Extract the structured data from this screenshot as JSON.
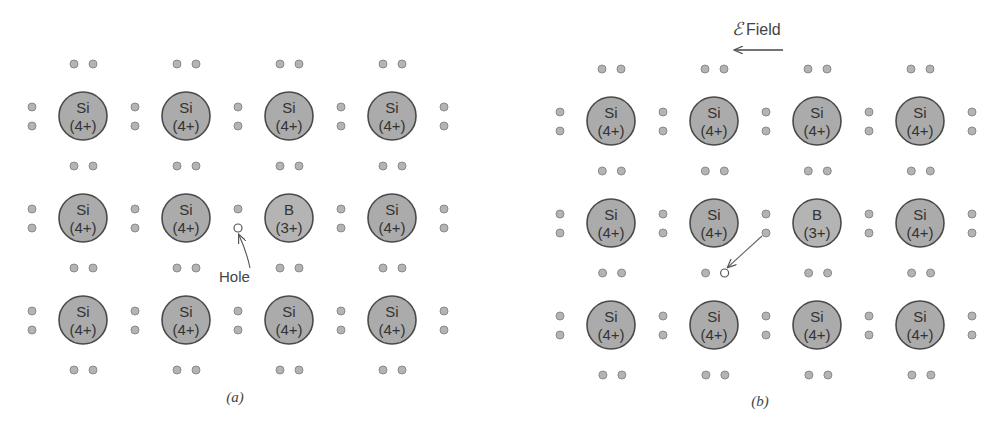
{
  "figure": {
    "panels": [
      {
        "id": "a",
        "caption": "(a)",
        "origin_x": 83,
        "origin_y": 116,
        "col_spacing": 103,
        "row_spacing": 102,
        "atoms": [
          [
            {
              "symbol": "Si",
              "charge": "(4+)"
            },
            {
              "symbol": "Si",
              "charge": "(4+)"
            },
            {
              "symbol": "Si",
              "charge": "(4+)"
            },
            {
              "symbol": "Si",
              "charge": "(4+)"
            }
          ],
          [
            {
              "symbol": "Si",
              "charge": "(4+)"
            },
            {
              "symbol": "Si",
              "charge": "(4+)"
            },
            {
              "symbol": "B",
              "charge": "(3+)"
            },
            {
              "symbol": "Si",
              "charge": "(4+)"
            }
          ],
          [
            {
              "symbol": "Si",
              "charge": "(4+)"
            },
            {
              "symbol": "Si",
              "charge": "(4+)"
            },
            {
              "symbol": "Si",
              "charge": "(4+)"
            },
            {
              "symbol": "Si",
              "charge": "(4+)"
            }
          ]
        ],
        "hole": {
          "x": 237,
          "y": 228,
          "label": "Hole",
          "label_x": 219,
          "label_y": 282
        }
      },
      {
        "id": "b",
        "caption": "(b)",
        "origin_x": 611,
        "origin_y": 121,
        "col_spacing": 103,
        "row_spacing": 102,
        "atoms": [
          [
            {
              "symbol": "Si",
              "charge": "(4+)"
            },
            {
              "symbol": "Si",
              "charge": "(4+)"
            },
            {
              "symbol": "Si",
              "charge": "(4+)"
            },
            {
              "symbol": "Si",
              "charge": "(4+)"
            }
          ],
          [
            {
              "symbol": "Si",
              "charge": "(4+)"
            },
            {
              "symbol": "Si",
              "charge": "(4+)"
            },
            {
              "symbol": "B",
              "charge": "(3+)"
            },
            {
              "symbol": "Si",
              "charge": "(4+)"
            }
          ],
          [
            {
              "symbol": "Si",
              "charge": "(4+)"
            },
            {
              "symbol": "Si",
              "charge": "(4+)"
            },
            {
              "symbol": "Si",
              "charge": "(4+)"
            },
            {
              "symbol": "Si",
              "charge": "(4+)"
            }
          ]
        ],
        "hole": {
          "x": 723,
          "y": 271
        },
        "moving_electron": {
          "x": 765,
          "y": 232
        }
      }
    ],
    "field": {
      "symbol": "ℰ",
      "label": "Field",
      "direction": "left"
    },
    "colors": {
      "atom_fill": "#ababab",
      "atom_stroke": "#4a4a4a",
      "electron_fill": "#b4b4b4",
      "electron_stroke": "#8a8a8a",
      "hole_fill": "#ffffff",
      "hole_stroke": "#555555",
      "arrow": "#666666"
    }
  }
}
